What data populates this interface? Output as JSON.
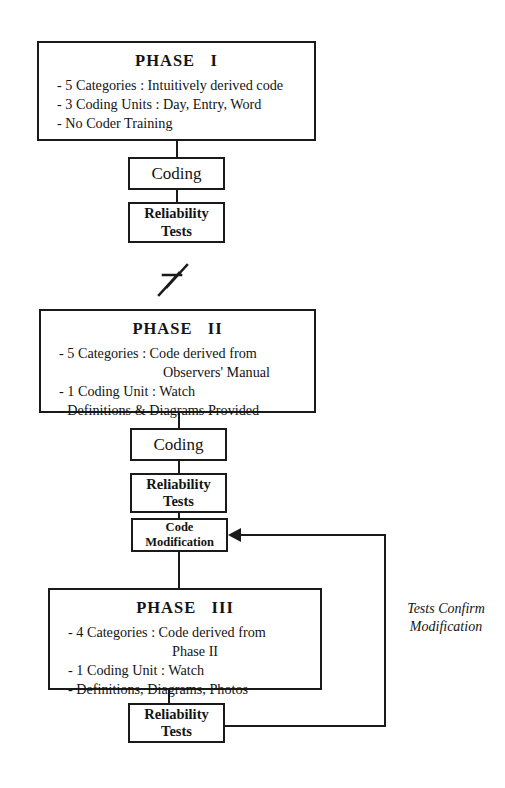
{
  "diagram": {
    "ink_color": "#1a1a1a",
    "background_color": "#ffffff"
  },
  "phase1": {
    "title": "PHASE   I",
    "bullets": [
      "- 5 Categories : Intuitively derived code",
      "- 3 Coding Units : Day, Entry, Word",
      "- No Coder Training"
    ]
  },
  "phase1_steps": {
    "coding": "Coding",
    "reliability_line1": "Reliability",
    "reliability_line2": "Tests"
  },
  "break_symbol": {
    "name": "break-lightning-symbol"
  },
  "phase2": {
    "title": "PHASE   II",
    "bullets": [
      "- 5 Categories : Code derived from",
      "- 1 Coding Unit : Watch",
      "- Definitions & Diagrams Provided"
    ],
    "bullet1_continuation": "Observers' Manual"
  },
  "phase2_steps": {
    "coding": "Coding",
    "reliability_line1": "Reliability",
    "reliability_line2": "Tests",
    "code_mod_line1": "Code",
    "code_mod_line2": "Modification"
  },
  "phase3": {
    "title": "PHASE   III",
    "bullets": [
      "- 4 Categories : Code derived from",
      "- 1 Coding Unit : Watch",
      "- Definitions, Diagrams, Photos"
    ],
    "bullet1_continuation": "Phase II"
  },
  "phase3_steps": {
    "reliability_line1": "Reliability",
    "reliability_line2": "Tests"
  },
  "feedback": {
    "label": "Tests Confirm\nModification"
  }
}
